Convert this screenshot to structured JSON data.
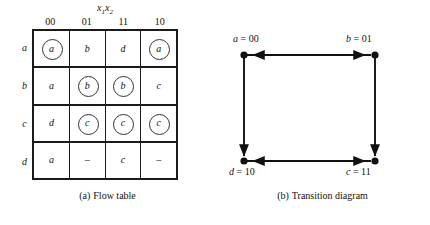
{
  "figure": {
    "panels": [
      {
        "id": "flow-table",
        "caption_label": "(a)",
        "caption_text": "Flow table"
      },
      {
        "id": "transition-diagram",
        "caption_label": "(b)",
        "caption_text": "Transition diagram"
      }
    ]
  },
  "flow_table": {
    "input_variable_label": "x",
    "input_var_sub_1": "1",
    "input_var_sub_2": "2",
    "column_headers": [
      "00",
      "01",
      "11",
      "10"
    ],
    "row_headers": [
      "a",
      "b",
      "c",
      "d"
    ],
    "rows": [
      {
        "label": "a",
        "cells": [
          {
            "value": "a",
            "stable": true
          },
          {
            "value": "b",
            "stable": false
          },
          {
            "value": "d",
            "stable": false
          },
          {
            "value": "a",
            "stable": true
          }
        ]
      },
      {
        "label": "b",
        "cells": [
          {
            "value": "a",
            "stable": false
          },
          {
            "value": "b",
            "stable": true
          },
          {
            "value": "b",
            "stable": true
          },
          {
            "value": "c",
            "stable": false
          }
        ]
      },
      {
        "label": "c",
        "cells": [
          {
            "value": "d",
            "stable": false
          },
          {
            "value": "c",
            "stable": true
          },
          {
            "value": "c",
            "stable": true
          },
          {
            "value": "c",
            "stable": true
          }
        ]
      },
      {
        "label": "d",
        "cells": [
          {
            "value": "a",
            "stable": false
          },
          {
            "value": "–",
            "stable": false
          },
          {
            "value": "c",
            "stable": false
          },
          {
            "value": "–",
            "stable": false
          }
        ]
      }
    ]
  },
  "transition_diagram": {
    "nodes": [
      {
        "id": "a",
        "state": "a",
        "equals": "=",
        "code": "00",
        "position": "top-left"
      },
      {
        "id": "b",
        "state": "b",
        "equals": "=",
        "code": "01",
        "position": "top-right"
      },
      {
        "id": "c",
        "state": "c",
        "equals": "=",
        "code": "11",
        "position": "bottom-right"
      },
      {
        "id": "d",
        "state": "d",
        "equals": "=",
        "code": "10",
        "position": "bottom-left"
      }
    ],
    "edges": [
      {
        "from": "a",
        "to": "b",
        "style": "bidirectional",
        "side": "top"
      },
      {
        "from": "b",
        "to": "c",
        "style": "directed",
        "side": "right"
      },
      {
        "from": "c",
        "to": "d",
        "style": "bidirectional",
        "side": "bottom"
      },
      {
        "from": "a",
        "to": "d",
        "style": "directed",
        "side": "left"
      }
    ]
  },
  "colors": {
    "ink": "#1a1a1a",
    "background": "#ffffff",
    "circle_stroke": "#333333"
  }
}
